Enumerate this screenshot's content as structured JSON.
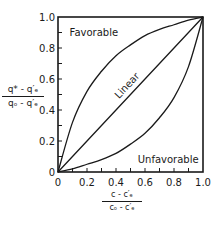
{
  "chart_data": {
    "type": "line",
    "title": "",
    "xlabel": "(c - c'_e) / (c_o - c'_e)",
    "xlabel_parts": {
      "numerator": "c - c′ₑ",
      "denominator": "cₒ - c′ₑ"
    },
    "ylabel": "(q* - q'_e) / (q_o - q'_e)",
    "ylabel_parts": {
      "numerator": "q* - q′ₑ",
      "denominator": "qₒ - q′ₑ"
    },
    "xlim": [
      0,
      1.0
    ],
    "ylim": [
      0,
      1.0
    ],
    "x_ticks": [
      "0",
      "0.2",
      "0.4",
      "0.6",
      "0.8",
      "1.0"
    ],
    "y_ticks": [
      "0",
      "0.2",
      "0.4",
      "0.6",
      "0.8",
      "1.0"
    ],
    "minor_tick_step": 0.1,
    "grid": false,
    "legend": "none (curves labeled inline)",
    "x": [
      0,
      0.1,
      0.2,
      0.3,
      0.4,
      0.5,
      0.6,
      0.7,
      0.8,
      0.9,
      1.0
    ],
    "series": [
      {
        "name": "Favorable",
        "values": [
          0,
          0.32,
          0.52,
          0.65,
          0.75,
          0.82,
          0.88,
          0.92,
          0.95,
          0.98,
          1.0
        ]
      },
      {
        "name": "Linear",
        "values": [
          0,
          0.1,
          0.2,
          0.3,
          0.4,
          0.5,
          0.6,
          0.7,
          0.8,
          0.9,
          1.0
        ]
      },
      {
        "name": "Unfavorable",
        "values": [
          0,
          0.02,
          0.05,
          0.08,
          0.12,
          0.18,
          0.25,
          0.35,
          0.48,
          0.68,
          1.0
        ]
      }
    ],
    "annotations": [
      {
        "text": "Favorable",
        "x": 0.08,
        "y": 0.88
      },
      {
        "text": "Linear",
        "x": 0.42,
        "y": 0.47,
        "rotation": -47
      },
      {
        "text": "Unfavorable",
        "x": 0.55,
        "y": 0.06
      }
    ]
  }
}
